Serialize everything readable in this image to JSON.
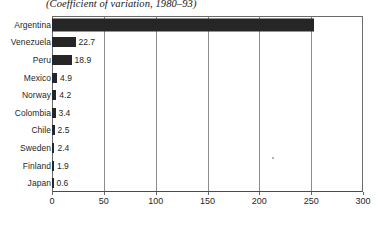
{
  "chart_data": {
    "type": "bar",
    "orientation": "horizontal",
    "title": "(Coefficient of variation, 1980–93)",
    "xlabel": "",
    "ylabel": "",
    "xlim": [
      0,
      300
    ],
    "xticks": [
      0,
      50,
      100,
      150,
      200,
      250,
      300
    ],
    "grid": true,
    "legend": false,
    "categories": [
      "Argentina",
      "Venezuela",
      "Peru",
      "Mexico",
      "Norway",
      "Colombia",
      "Chile",
      "Sweden",
      "Finland",
      "Japan"
    ],
    "values": [
      252.7,
      22.7,
      18.9,
      4.9,
      4.2,
      3.4,
      2.5,
      2.4,
      1.9,
      0.6
    ],
    "value_labels": [
      "",
      "22.7",
      "18.9",
      "4.9",
      "4.2",
      "3.4",
      "2.5",
      "2.4",
      "1.9",
      "0.6"
    ],
    "bar_color": "#262626",
    "axis_color": "#6b6b6b",
    "grid_color": "#8c8c8c",
    "background": "#ffffff"
  }
}
